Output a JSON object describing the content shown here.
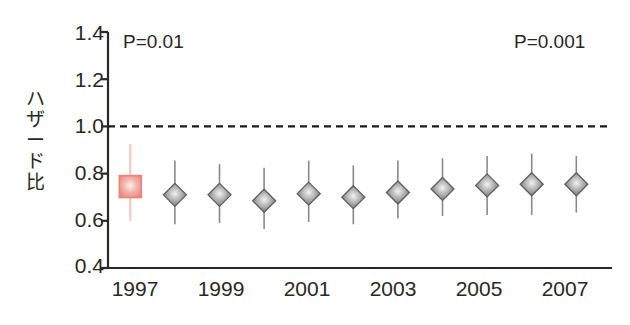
{
  "chart_data": {
    "type": "scatter",
    "title": "",
    "xlabel": "",
    "ylabel": "ハザード比",
    "ylim": [
      0.4,
      1.4
    ],
    "yticks": [
      0.4,
      0.6,
      0.8,
      1.0,
      1.2,
      1.4
    ],
    "ytick_labels": [
      "0.4",
      "0.6",
      "0.8",
      "1.0",
      "1.2",
      "1.4"
    ],
    "xlim": [
      1996.5,
      2007.8
    ],
    "x": [
      1997,
      1998,
      1999,
      2000,
      2001,
      2002,
      2003,
      2004,
      2005,
      2006,
      2007
    ],
    "xtick_labels": [
      "1997",
      "1999",
      "2001",
      "2003",
      "2005",
      "2007"
    ],
    "xticks": [
      1997,
      1999,
      2001,
      2003,
      2005,
      2007
    ],
    "grid": false,
    "legend": "none",
    "reference_line": {
      "y": 1.0,
      "style": "dashed",
      "color": "#1a1a1a"
    },
    "values": [
      0.745,
      0.71,
      0.71,
      0.685,
      0.715,
      0.7,
      0.72,
      0.735,
      0.75,
      0.755,
      0.755
    ],
    "ci_low": [
      0.6,
      0.585,
      0.59,
      0.565,
      0.595,
      0.585,
      0.61,
      0.62,
      0.625,
      0.625,
      0.635
    ],
    "ci_high": [
      0.925,
      0.855,
      0.84,
      0.825,
      0.855,
      0.835,
      0.855,
      0.865,
      0.875,
      0.885,
      0.875
    ],
    "marker_shapes": [
      "square",
      "diamond",
      "diamond",
      "diamond",
      "diamond",
      "diamond",
      "diamond",
      "diamond",
      "diamond",
      "diamond",
      "diamond"
    ],
    "marker_colors": [
      "#e8857c",
      "#6e6e6e",
      "#6e6e6e",
      "#6e6e6e",
      "#6e6e6e",
      "#6e6e6e",
      "#6e6e6e",
      "#6e6e6e",
      "#6e6e6e",
      "#6e6e6e",
      "#6e6e6e"
    ],
    "annotations": [
      {
        "name": "p-value-left",
        "text": "P=0.01",
        "x": 1997.2,
        "y": 1.32
      },
      {
        "name": "p-value-right",
        "text": "P=0.001",
        "x": 2006.6,
        "y": 1.32
      }
    ]
  },
  "axes": {
    "y_label_text": "ハザード比",
    "y_tick_labels": [
      "1.4",
      "1.2",
      "1.0",
      "0.8",
      "0.6",
      "0.4"
    ],
    "x_tick_labels": [
      "1997",
      "1999",
      "2001",
      "2003",
      "2005",
      "2007"
    ]
  },
  "annotations": {
    "p_left": "P=0.01",
    "p_right": "P=0.001"
  },
  "colors": {
    "highlight": "#e8857c",
    "marker": "#6e6e6e",
    "axis": "#2b2724",
    "reference": "#1a1a1a",
    "background": "#ffffff"
  }
}
